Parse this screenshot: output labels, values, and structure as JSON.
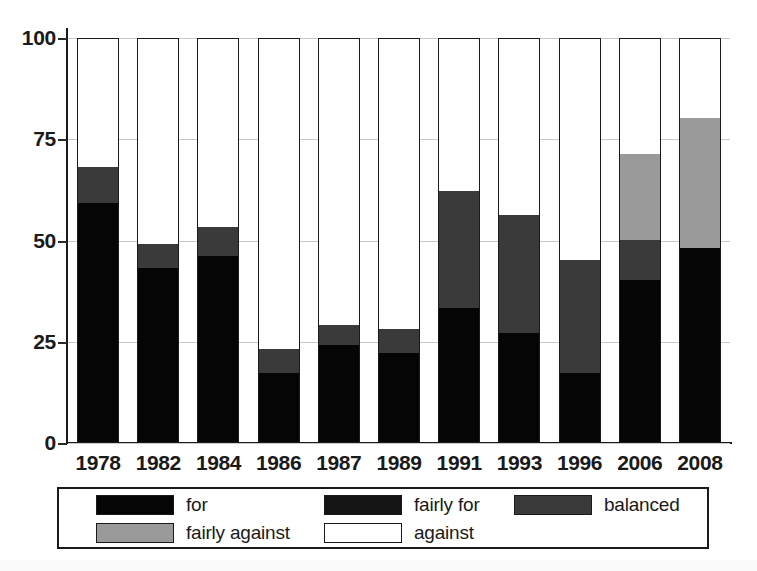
{
  "chart_data": {
    "type": "bar",
    "subtype": "stacked-bar-100-percent",
    "title": "",
    "subtitle": "",
    "xlabel": "",
    "ylabel": "",
    "ylim": [
      0,
      100
    ],
    "yticks": [
      0,
      25,
      50,
      75,
      100
    ],
    "ytick_labels": [
      "0",
      "25",
      "50",
      "75",
      "100"
    ],
    "grid": true,
    "grid_axis": "y",
    "legend_position": "below-axis",
    "stack_order_bottom_to_top": [
      "for",
      "fairly for",
      "balanced",
      "fairly against",
      "against"
    ],
    "categories": [
      "1978",
      "1982",
      "1984",
      "1986",
      "1987",
      "1989",
      "1991",
      "1993",
      "1996",
      "2006",
      "2008"
    ],
    "series": [
      {
        "name": "for",
        "color": "#050505",
        "values": [
          59,
          43,
          46,
          17,
          24,
          22,
          33,
          27,
          17,
          40,
          48
        ]
      },
      {
        "name": "fairly for",
        "color": "#141414",
        "values": [
          0,
          0,
          0,
          0,
          0,
          0,
          0,
          0,
          0,
          0,
          0
        ]
      },
      {
        "name": "balanced",
        "color": "#3a3a3a",
        "values": [
          9,
          6,
          7,
          6,
          5,
          6,
          29,
          29,
          28,
          10,
          0
        ]
      },
      {
        "name": "fairly against",
        "color": "#9a9a9a",
        "values": [
          0,
          0,
          0,
          0,
          0,
          0,
          0,
          0,
          0,
          21,
          32
        ]
      },
      {
        "name": "against",
        "color": "#ffffff",
        "values": [
          32,
          51,
          47,
          77,
          71,
          72,
          38,
          44,
          55,
          29,
          20
        ]
      }
    ],
    "cumulative_tops": {
      "1978": {
        "for": 59,
        "balanced": 68,
        "against": 100
      },
      "1982": {
        "for": 43,
        "balanced": 49,
        "against": 100
      },
      "1984": {
        "for": 46,
        "balanced": 53,
        "against": 100
      },
      "1986": {
        "for": 17,
        "balanced": 23,
        "against": 100
      },
      "1987": {
        "for": 24,
        "balanced": 29,
        "against": 100
      },
      "1989": {
        "for": 22,
        "balanced": 28,
        "against": 100
      },
      "1991": {
        "for": 33,
        "balanced": 62,
        "against": 100
      },
      "1993": {
        "for": 27,
        "balanced": 56,
        "against": 100
      },
      "1996": {
        "for": 17,
        "balanced": 45,
        "against": 100
      },
      "2006": {
        "for": 40,
        "balanced": 50,
        "fairly against": 71,
        "against": 100
      },
      "2008": {
        "for": 48,
        "fairly against": 80,
        "against": 100
      }
    }
  },
  "axis": {
    "y_ticks": [
      {
        "label": "100",
        "value": 100
      },
      {
        "label": "75",
        "value": 75
      },
      {
        "label": "50",
        "value": 50
      },
      {
        "label": "25",
        "value": 25
      },
      {
        "label": "0",
        "value": 0
      }
    ],
    "x_ticks": [
      {
        "label": "1978"
      },
      {
        "label": "1982"
      },
      {
        "label": "1984"
      },
      {
        "label": "1986"
      },
      {
        "label": "1987"
      },
      {
        "label": "1989"
      },
      {
        "label": "1991"
      },
      {
        "label": "1993"
      },
      {
        "label": "1996"
      },
      {
        "label": "2006"
      },
      {
        "label": "2008"
      }
    ]
  },
  "legend": {
    "items": [
      {
        "label": "for",
        "color": "#050505",
        "slot": "li-for"
      },
      {
        "label": "fairly for",
        "color": "#141414",
        "slot": "li-fairly-for"
      },
      {
        "label": "balanced",
        "color": "#3a3a3a",
        "slot": "li-balanced"
      },
      {
        "label": "fairly against",
        "color": "#9a9a9a",
        "slot": "li-fairly-against"
      },
      {
        "label": "against",
        "color": "#ffffff",
        "slot": "li-against"
      }
    ]
  },
  "colors": {
    "for": "#050505",
    "fairly_for": "#141414",
    "balanced": "#3a3a3a",
    "fairly_against": "#9a9a9a",
    "against": "#ffffff",
    "axis": "#1a1a1a",
    "grid": "#c9c9c9",
    "background": "#ffffff"
  }
}
